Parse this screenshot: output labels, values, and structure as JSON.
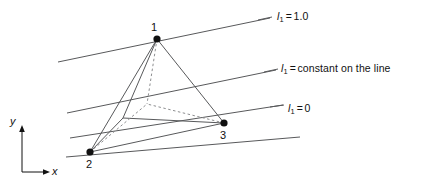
{
  "figure": {
    "type": "tetrahedron-area-coordinate-diagram",
    "background_color": "#ffffff",
    "line_color": "#3f3f3f",
    "text_color": "#111111"
  },
  "nodes": [
    {
      "id": "node-1",
      "label": "1",
      "x": 157,
      "y": 39,
      "label_x": 151,
      "label_y": 22
    },
    {
      "id": "node-2",
      "label": "2",
      "x": 90,
      "y": 152,
      "label_x": 86,
      "label_y": 159
    },
    {
      "id": "node-3",
      "label": "3",
      "x": 224,
      "y": 123,
      "label_x": 220,
      "label_y": 130
    }
  ],
  "hidden_node": {
    "id": "node-4",
    "label": "",
    "x": 147,
    "y": 104
  },
  "iso_lines": [
    {
      "id": "iso-line-top",
      "symbol": "l",
      "subscript": "1",
      "equals": "=",
      "value": "1.0",
      "text": "l1 = 1.0",
      "label_x": 277,
      "label_y": 11,
      "x1": 58,
      "y1": 62,
      "x2": 270,
      "y2": 18
    },
    {
      "id": "iso-line-middle",
      "symbol": "l",
      "subscript": "1",
      "equals": "=",
      "value": "constant on the line",
      "text": "l1 = constant on the line",
      "label_x": 281,
      "label_y": 63,
      "x1": 67,
      "y1": 113,
      "x2": 276,
      "y2": 70
    },
    {
      "id": "iso-line-bottom",
      "symbol": "l",
      "subscript": "1",
      "equals": "=",
      "value": "0",
      "text": "l1 = 0",
      "label_x": 288,
      "label_y": 103,
      "x1": 70,
      "y1": 138,
      "x2": 283,
      "y2": 105
    }
  ],
  "base_line": {
    "id": "base-line",
    "x1": 66,
    "y1": 157,
    "x2": 300,
    "y2": 137
  },
  "axes": {
    "x": {
      "label": "x",
      "label_x": 52,
      "label_y": 167
    },
    "y": {
      "label": "y",
      "label_x": 10,
      "label_y": 116
    },
    "origin_x": 22,
    "origin_y": 172,
    "x_end": 48,
    "y_end": 128
  }
}
